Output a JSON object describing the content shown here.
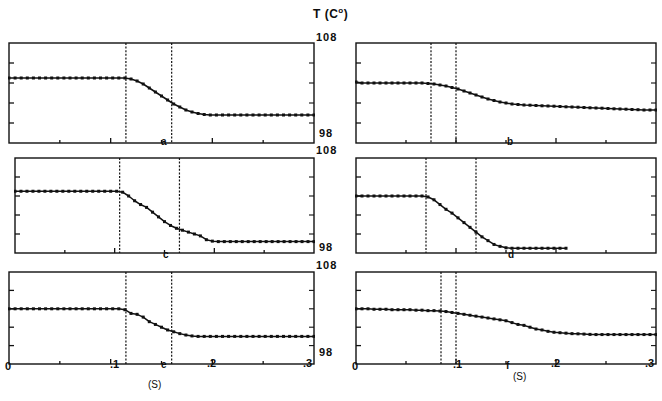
{
  "figure": {
    "axis_title": "T  (C",
    "axis_title_sup": "o",
    "axis_title_close": ")",
    "y_top_label": "108",
    "y_bottom_label": "98",
    "x_unit_label": "(S)",
    "x_unit_label_right": "(S)",
    "ink_color": "#111111",
    "background_color": "#ffffff"
  },
  "x_axis": {
    "min": 0.0,
    "max": 0.3,
    "ticks": [
      0.0,
      0.1,
      0.2,
      0.3
    ],
    "tick_labels": [
      "0",
      ".1",
      ".2",
      ".3"
    ],
    "minor_ticks": [
      0.05,
      0.15,
      0.25
    ],
    "label": "(S)"
  },
  "y_axis": {
    "min": 98,
    "max": 108,
    "ticks": [
      98,
      100,
      102,
      104,
      106,
      108
    ],
    "tick_labels": [
      "98",
      "",
      "",
      "",
      "",
      "108"
    ],
    "label": "T (C°)"
  },
  "chart_data": {
    "type": "line",
    "xlabel": "(S)",
    "ylabel": "T (C°)",
    "xlim": [
      0.0,
      0.3
    ],
    "ylim": [
      98,
      108
    ],
    "grid": false,
    "legend": "none",
    "marker": "filled-square",
    "panel_layout": {
      "rows": 3,
      "cols": 2
    },
    "panels": [
      {
        "id": "a",
        "label": "a",
        "row": 0,
        "col": 0,
        "markers_dashed_x": [
          0.115,
          0.16
        ],
        "x": [
          0.0,
          0.006,
          0.012,
          0.018,
          0.024,
          0.03,
          0.036,
          0.042,
          0.048,
          0.054,
          0.06,
          0.066,
          0.072,
          0.078,
          0.084,
          0.09,
          0.096,
          0.102,
          0.108,
          0.114,
          0.12,
          0.126,
          0.132,
          0.138,
          0.144,
          0.15,
          0.156,
          0.162,
          0.168,
          0.174,
          0.18,
          0.186,
          0.192,
          0.198,
          0.204,
          0.21,
          0.216,
          0.222,
          0.228,
          0.234,
          0.24,
          0.246,
          0.252,
          0.258,
          0.264,
          0.27,
          0.276,
          0.282,
          0.288,
          0.294,
          0.3
        ],
        "y": [
          104.5,
          104.5,
          104.5,
          104.5,
          104.5,
          104.5,
          104.5,
          104.5,
          104.5,
          104.5,
          104.5,
          104.5,
          104.5,
          104.5,
          104.5,
          104.5,
          104.5,
          104.5,
          104.5,
          104.5,
          104.4,
          104.2,
          103.9,
          103.5,
          103.1,
          102.7,
          102.3,
          101.9,
          101.6,
          101.3,
          101.1,
          100.95,
          100.85,
          100.8,
          100.8,
          100.8,
          100.8,
          100.8,
          100.8,
          100.8,
          100.8,
          100.8,
          100.8,
          100.8,
          100.8,
          100.8,
          100.8,
          100.8,
          100.8,
          100.8,
          100.8
        ]
      },
      {
        "id": "b",
        "label": "b",
        "row": 0,
        "col": 1,
        "markers_dashed_x": [
          0.075,
          0.1
        ],
        "x": [
          0.0,
          0.006,
          0.012,
          0.018,
          0.024,
          0.03,
          0.036,
          0.042,
          0.048,
          0.054,
          0.06,
          0.066,
          0.072,
          0.078,
          0.084,
          0.09,
          0.096,
          0.102,
          0.108,
          0.114,
          0.12,
          0.126,
          0.132,
          0.138,
          0.144,
          0.15,
          0.156,
          0.162,
          0.168,
          0.174,
          0.18,
          0.186,
          0.192,
          0.198,
          0.204,
          0.21,
          0.216,
          0.222,
          0.228,
          0.234,
          0.24,
          0.246,
          0.252,
          0.258,
          0.264,
          0.27,
          0.276,
          0.282,
          0.288,
          0.294,
          0.3
        ],
        "y": [
          104.1,
          104.0,
          104.0,
          104.0,
          104.0,
          104.0,
          104.0,
          104.0,
          104.0,
          104.0,
          104.0,
          104.0,
          103.95,
          103.9,
          103.8,
          103.7,
          103.55,
          103.4,
          103.2,
          103.0,
          102.8,
          102.6,
          102.4,
          102.25,
          102.1,
          102.0,
          101.9,
          101.85,
          101.8,
          101.78,
          101.75,
          101.72,
          101.7,
          101.68,
          101.65,
          101.62,
          101.6,
          101.58,
          101.55,
          101.52,
          101.5,
          101.48,
          101.45,
          101.42,
          101.4,
          101.38,
          101.35,
          101.33,
          101.3,
          101.3,
          101.3
        ]
      },
      {
        "id": "c",
        "label": "c",
        "row": 1,
        "col": 0,
        "markers_dashed_x": [
          0.105,
          0.165
        ],
        "x": [
          0.0,
          0.006,
          0.012,
          0.018,
          0.024,
          0.03,
          0.036,
          0.042,
          0.048,
          0.054,
          0.06,
          0.066,
          0.072,
          0.078,
          0.084,
          0.09,
          0.096,
          0.102,
          0.108,
          0.114,
          0.12,
          0.126,
          0.132,
          0.138,
          0.144,
          0.15,
          0.156,
          0.162,
          0.168,
          0.174,
          0.18,
          0.186,
          0.192,
          0.198,
          0.204,
          0.21,
          0.216,
          0.222,
          0.228,
          0.234,
          0.24,
          0.246,
          0.252,
          0.258,
          0.264,
          0.27,
          0.276,
          0.282,
          0.288,
          0.294,
          0.3
        ],
        "y": [
          104.5,
          104.5,
          104.5,
          104.5,
          104.5,
          104.5,
          104.5,
          104.5,
          104.5,
          104.5,
          104.5,
          104.5,
          104.5,
          104.5,
          104.5,
          104.5,
          104.5,
          104.5,
          104.4,
          104.0,
          103.5,
          103.1,
          102.8,
          102.3,
          101.8,
          101.3,
          100.9,
          100.6,
          100.4,
          100.2,
          100.0,
          99.8,
          99.4,
          99.25,
          99.2,
          99.2,
          99.2,
          99.2,
          99.2,
          99.2,
          99.2,
          99.2,
          99.2,
          99.2,
          99.2,
          99.2,
          99.2,
          99.2,
          99.2,
          99.2,
          99.2
        ]
      },
      {
        "id": "d",
        "label": "d",
        "row": 1,
        "col": 1,
        "markers_dashed_x": [
          0.07,
          0.12
        ],
        "x": [
          0.0,
          0.006,
          0.012,
          0.018,
          0.024,
          0.03,
          0.036,
          0.042,
          0.048,
          0.054,
          0.06,
          0.066,
          0.072,
          0.078,
          0.084,
          0.09,
          0.096,
          0.102,
          0.108,
          0.114,
          0.12,
          0.126,
          0.132,
          0.138,
          0.144,
          0.15,
          0.156,
          0.162,
          0.168,
          0.174,
          0.18,
          0.186,
          0.192,
          0.198,
          0.204,
          0.21
        ],
        "y": [
          104.0,
          104.0,
          104.0,
          104.0,
          104.0,
          104.0,
          104.0,
          104.0,
          104.0,
          104.0,
          104.0,
          104.0,
          103.9,
          103.6,
          103.1,
          102.6,
          102.2,
          101.7,
          101.2,
          100.7,
          100.2,
          99.7,
          99.3,
          98.9,
          98.7,
          98.55,
          98.5,
          98.5,
          98.5,
          98.5,
          98.5,
          98.5,
          98.5,
          98.5,
          98.5,
          98.5
        ]
      },
      {
        "id": "e",
        "label": "e",
        "row": 2,
        "col": 0,
        "markers_dashed_x": [
          0.115,
          0.16
        ],
        "x": [
          0.0,
          0.006,
          0.012,
          0.018,
          0.024,
          0.03,
          0.036,
          0.042,
          0.048,
          0.054,
          0.06,
          0.066,
          0.072,
          0.078,
          0.084,
          0.09,
          0.096,
          0.102,
          0.108,
          0.114,
          0.12,
          0.126,
          0.132,
          0.138,
          0.144,
          0.15,
          0.156,
          0.162,
          0.168,
          0.174,
          0.18,
          0.186,
          0.192,
          0.198,
          0.204,
          0.21,
          0.216,
          0.222,
          0.228,
          0.234,
          0.24,
          0.246,
          0.252,
          0.258,
          0.264,
          0.27,
          0.276,
          0.282,
          0.288,
          0.294,
          0.3
        ],
        "y": [
          104.0,
          104.0,
          104.0,
          104.0,
          104.0,
          104.0,
          104.0,
          104.0,
          104.0,
          104.0,
          104.0,
          104.0,
          104.0,
          104.0,
          104.0,
          104.0,
          104.0,
          104.0,
          104.0,
          103.9,
          103.5,
          103.4,
          103.1,
          102.6,
          102.3,
          102.0,
          101.7,
          101.5,
          101.3,
          101.15,
          101.05,
          101.0,
          101.0,
          101.0,
          101.0,
          101.0,
          101.0,
          101.0,
          101.0,
          101.0,
          101.0,
          101.0,
          101.0,
          101.0,
          101.0,
          101.0,
          101.0,
          101.0,
          101.0,
          101.0,
          101.0
        ]
      },
      {
        "id": "f",
        "label": "f",
        "row": 2,
        "col": 1,
        "markers_dashed_x": [
          0.085,
          0.1
        ],
        "x": [
          0.0,
          0.006,
          0.012,
          0.018,
          0.024,
          0.03,
          0.036,
          0.042,
          0.048,
          0.054,
          0.06,
          0.066,
          0.072,
          0.078,
          0.084,
          0.09,
          0.096,
          0.102,
          0.108,
          0.114,
          0.12,
          0.126,
          0.132,
          0.138,
          0.144,
          0.15,
          0.156,
          0.162,
          0.168,
          0.174,
          0.18,
          0.186,
          0.192,
          0.198,
          0.204,
          0.21,
          0.216,
          0.222,
          0.228,
          0.234,
          0.24,
          0.246,
          0.252,
          0.258,
          0.264,
          0.27,
          0.276,
          0.282,
          0.288,
          0.294,
          0.3
        ],
        "y": [
          104.0,
          104.0,
          104.0,
          103.95,
          103.95,
          103.95,
          103.9,
          103.9,
          103.9,
          103.9,
          103.85,
          103.85,
          103.8,
          103.8,
          103.75,
          103.7,
          103.6,
          103.5,
          103.4,
          103.3,
          103.2,
          103.1,
          103.0,
          102.9,
          102.8,
          102.7,
          102.5,
          102.3,
          102.2,
          102.0,
          101.8,
          101.7,
          101.55,
          101.45,
          101.4,
          101.35,
          101.3,
          101.28,
          101.25,
          101.22,
          101.2,
          101.2,
          101.2,
          101.2,
          101.2,
          101.2,
          101.2,
          101.2,
          101.2,
          101.2,
          101.2
        ]
      }
    ]
  }
}
